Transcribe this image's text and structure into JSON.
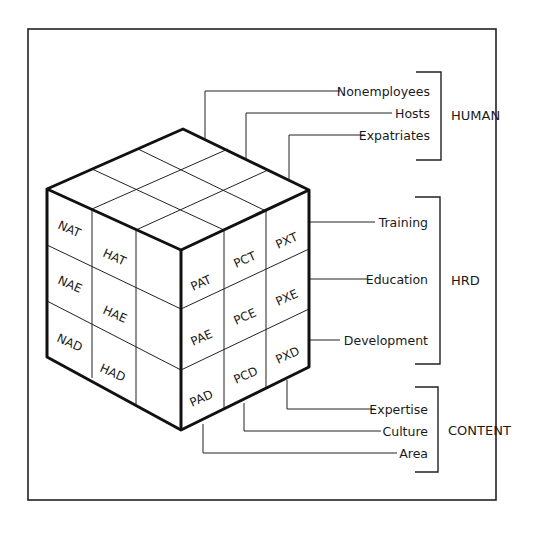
{
  "diagram": {
    "frame": {
      "stroke": "#222222"
    },
    "groups": [
      {
        "name": "HUMAN",
        "items": [
          "Nonemployees",
          "Hosts",
          "Expatriates"
        ]
      },
      {
        "name": "HRD",
        "items": [
          "Training",
          "Education",
          "Development"
        ]
      },
      {
        "name": "CONTENT",
        "items": [
          "Expertise",
          "Culture",
          "Area"
        ]
      }
    ],
    "left_face": {
      "rows": [
        [
          "NAT",
          "HAT",
          ""
        ],
        [
          "NAE",
          "HAE",
          ""
        ],
        [
          "NAD",
          "HAD",
          ""
        ]
      ]
    },
    "right_face": {
      "rows": [
        [
          "PAT",
          "PCT",
          "PXT"
        ],
        [
          "PAE",
          "PCE",
          "PXE"
        ],
        [
          "PAD",
          "PCD",
          "PXD"
        ]
      ]
    }
  }
}
